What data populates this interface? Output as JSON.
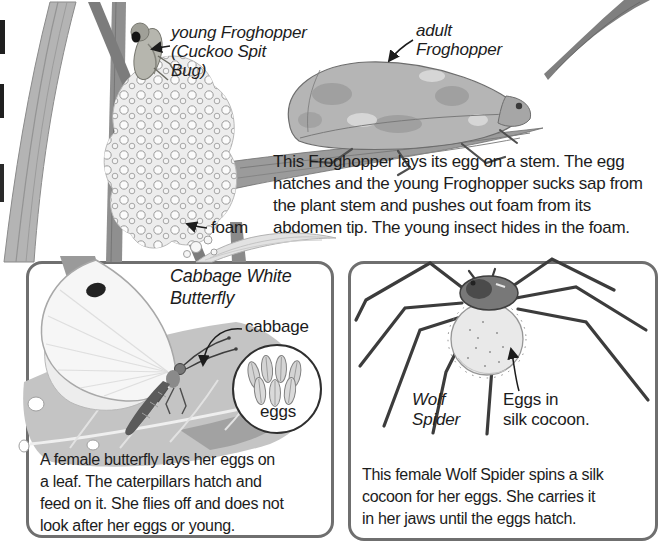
{
  "colors": {
    "ink": "#1c1c1c",
    "boxborder": "#6f6f6f",
    "paper": "#ffffff"
  },
  "top_section": {
    "young_froghopper_label": "young Froghopper\n(Cuckoo Spit\nBug)",
    "adult_froghopper_label": "adult\nFroghopper",
    "foam_label": "foam",
    "paragraph": "This Froghopper lays its egg on a stem. The egg\nhatches and the young Froghopper sucks sap from\nthe plant stem and pushes out foam from its\nabdomen tip. The young insect hides in the foam."
  },
  "butterfly_box": {
    "title": "Cabbage White\nButterfly",
    "cabbage_label": "cabbage",
    "eggs_label": "eggs",
    "caption": "A female butterfly lays her eggs on\na leaf. The caterpillars hatch and\nfeed on it. She flies off and does not\nlook after her eggs or young."
  },
  "spider_box": {
    "species_label": "Wolf\nSpider",
    "cocoon_label": "Eggs in\nsilk cocoon.",
    "caption": "This female Wolf Spider spins a silk\ncocoon for her eggs. She carries it\nin her jaws until the eggs hatch."
  }
}
